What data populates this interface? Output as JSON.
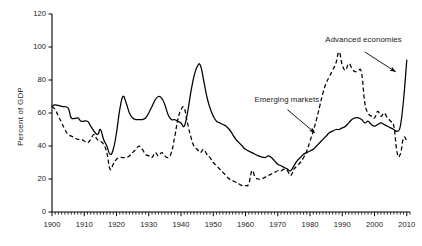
{
  "chart_data": {
    "type": "line",
    "title": "",
    "subtitle": "",
    "xlabel": "",
    "ylabel": "Percent of GDP",
    "xlim": [
      1900,
      2011
    ],
    "ylim": [
      0,
      120
    ],
    "yticks": [
      0,
      20,
      40,
      60,
      80,
      100,
      120
    ],
    "xticks": [
      1900,
      1910,
      1920,
      1930,
      1940,
      1950,
      1960,
      1970,
      1980,
      1990,
      2000,
      2010
    ],
    "xtick_labels": [
      "1900",
      "1910",
      "1920",
      "1930",
      "1940",
      "1950",
      "1960",
      "1970",
      "1980",
      "1990",
      "2000",
      "2010"
    ],
    "ytick_labels": [
      "0",
      "20",
      "40",
      "60",
      "80",
      "100",
      "120"
    ],
    "x_minor_tick_interval": 1,
    "grid": false,
    "legend_position": "none",
    "annotations": [
      {
        "name": "emerging-markets-annotation",
        "text": "Emerging markets",
        "label_x": 1964.0,
        "label_y": 68.0,
        "arrow_from_x": 1973.0,
        "arrow_from_y": 62.0,
        "arrow_to_x": 1981.5,
        "arrow_to_y": 48.0,
        "series": "Emerging markets"
      },
      {
        "name": "advanced-economies-annotation",
        "text": "Advanced economies",
        "label_x": 1986.0,
        "label_y": 104.0,
        "arrow_from_x": 1997.0,
        "arrow_from_y": 97.0,
        "arrow_to_x": 2006.5,
        "arrow_to_y": 85.0,
        "series": "Advanced economies"
      }
    ],
    "series": [
      {
        "name": "Advanced economies",
        "style": "solid",
        "color": "#000000",
        "x": [
          1900,
          1901,
          1902,
          1903,
          1904,
          1905,
          1906,
          1907,
          1908,
          1909,
          1910,
          1911,
          1912,
          1913,
          1914,
          1915,
          1916,
          1917,
          1918,
          1919,
          1920,
          1921,
          1922,
          1923,
          1924,
          1925,
          1926,
          1927,
          1928,
          1929,
          1930,
          1931,
          1932,
          1933,
          1934,
          1935,
          1936,
          1937,
          1938,
          1939,
          1940,
          1941,
          1942,
          1943,
          1944,
          1945,
          1946,
          1947,
          1948,
          1949,
          1950,
          1951,
          1952,
          1953,
          1954,
          1955,
          1956,
          1957,
          1958,
          1959,
          1960,
          1961,
          1962,
          1963,
          1964,
          1965,
          1966,
          1967,
          1968,
          1969,
          1970,
          1971,
          1972,
          1973,
          1974,
          1975,
          1976,
          1977,
          1978,
          1979,
          1980,
          1981,
          1982,
          1983,
          1984,
          1985,
          1986,
          1987,
          1988,
          1989,
          1990,
          1991,
          1992,
          1993,
          1994,
          1995,
          1996,
          1997,
          1998,
          1999,
          2000,
          2001,
          2002,
          2003,
          2004,
          2005,
          2006,
          2007,
          2008,
          2009,
          2010
        ],
        "values": [
          64,
          65,
          64,
          63,
          64,
          63,
          62,
          61,
          59,
          57,
          56,
          56,
          55,
          54,
          53,
          52,
          51,
          49,
          46,
          47,
          49,
          52,
          53,
          52,
          50,
          48,
          47,
          46,
          46,
          45,
          44,
          43,
          45,
          46,
          47,
          47,
          46,
          44,
          43,
          42,
          41,
          42,
          44,
          46,
          47,
          48,
          48,
          45,
          41,
          36,
          31,
          28,
          26,
          24,
          23,
          22,
          21,
          20,
          19,
          19,
          18,
          17,
          16,
          15,
          14,
          13,
          12,
          12,
          13,
          13,
          12,
          11,
          11,
          12,
          13,
          15,
          17,
          19,
          21,
          23,
          25,
          27,
          30,
          33,
          36,
          38,
          40,
          41,
          42,
          43,
          45,
          47,
          50,
          53,
          55,
          57,
          56,
          54,
          53,
          52,
          51,
          50,
          50,
          50,
          49,
          48,
          47,
          46,
          48,
          57,
          92
        ]
      },
      {
        "name": "Emerging markets",
        "style": "dashed",
        "color": "#000000",
        "x": [
          1900,
          1901,
          1902,
          1903,
          1904,
          1905,
          1906,
          1907,
          1908,
          1909,
          1910,
          1911,
          1912,
          1913,
          1914,
          1915,
          1916,
          1917,
          1918,
          1919,
          1920,
          1921,
          1922,
          1923,
          1924,
          1925,
          1926,
          1927,
          1928,
          1929,
          1930,
          1931,
          1932,
          1933,
          1934,
          1935,
          1936,
          1937,
          1938,
          1939,
          1940,
          1941,
          1942,
          1943,
          1944,
          1945,
          1946,
          1947,
          1948,
          1949,
          1950,
          1951,
          1952,
          1953,
          1954,
          1955,
          1956,
          1957,
          1958,
          1959,
          1960,
          1961,
          1962,
          1963,
          1964,
          1965,
          1966,
          1967,
          1968,
          1969,
          1970,
          1971,
          1972,
          1973,
          1974,
          1975,
          1976,
          1977,
          1978,
          1979,
          1980,
          1981,
          1982,
          1983,
          1984,
          1985,
          1986,
          1987,
          1988,
          1989,
          1990,
          1991,
          1992,
          1993,
          1994,
          1995,
          1996,
          1997,
          1998,
          1999,
          2000,
          2001,
          2002,
          2003,
          2004,
          2005,
          2006,
          2007,
          2008,
          2009,
          2010
        ],
        "values": [
          64,
          62,
          59,
          56,
          54,
          52,
          50,
          48,
          47,
          46,
          44,
          43,
          42,
          41,
          44,
          43,
          40,
          38,
          36,
          35,
          34,
          33,
          33,
          34,
          35,
          36,
          37,
          38,
          39,
          40,
          41,
          42,
          43,
          44,
          44,
          43,
          42,
          41,
          40,
          39,
          39,
          38,
          38,
          37,
          36,
          35,
          34,
          33,
          32,
          31,
          30,
          29,
          28,
          28,
          27,
          26,
          25,
          24,
          24,
          23,
          23,
          22,
          21,
          21,
          20,
          20,
          19,
          18,
          18,
          17,
          17,
          17,
          17,
          17,
          16,
          15,
          15,
          15,
          15,
          15,
          16,
          16,
          17,
          17,
          17,
          17,
          16,
          16,
          16,
          15,
          15,
          15,
          14,
          14,
          14,
          14,
          15,
          15,
          16,
          16,
          15,
          15,
          16,
          17,
          19,
          20,
          20,
          20,
          21,
          23,
          25
        ]
      }
    ],
    "series_visual_note": {
      "Advanced economies": "solid black line, starts ~64 in 1900, falls to ~35 by 1918, peaks ~70 in 1922 and ~70 in 1933, WWII peak ~89 in 1946, trough ~25 in 1974, rises to ~57 in 1995, dips to ~48 by 2007, sharp spike to ~92 in 2010",
      "Emerging markets": "dashed black line, starts ~64 in 1900, falls to ~26 in 1918, recovers to ~40 in 1932 peak ~63, lows ~14-16 through 1950s, bump ~25 in 1962, trough ~22 in 1974, climbs steeply to peak ~97 in 1989, falls to ~35 by 2008, ends ~43 in 2010"
    }
  },
  "chart_points": {
    "advanced": [
      [
        1900,
        64
      ],
      [
        1901,
        65
      ],
      [
        1903,
        64
      ],
      [
        1905,
        63
      ],
      [
        1906,
        57
      ],
      [
        1908,
        57
      ],
      [
        1909,
        55
      ],
      [
        1911,
        55
      ],
      [
        1912,
        52
      ],
      [
        1914,
        47
      ],
      [
        1915,
        50
      ],
      [
        1916,
        44
      ],
      [
        1917,
        40
      ],
      [
        1918,
        35
      ],
      [
        1919,
        38
      ],
      [
        1920,
        48
      ],
      [
        1921,
        62
      ],
      [
        1922,
        70
      ],
      [
        1923,
        66
      ],
      [
        1924,
        60
      ],
      [
        1925,
        57
      ],
      [
        1926,
        56
      ],
      [
        1927,
        56
      ],
      [
        1928,
        56
      ],
      [
        1929,
        57
      ],
      [
        1930,
        60
      ],
      [
        1931,
        64
      ],
      [
        1932,
        68
      ],
      [
        1933,
        70
      ],
      [
        1934,
        69
      ],
      [
        1935,
        65
      ],
      [
        1936,
        59
      ],
      [
        1937,
        56
      ],
      [
        1938,
        56
      ],
      [
        1939,
        55
      ],
      [
        1940,
        54
      ],
      [
        1941,
        52
      ],
      [
        1942,
        60
      ],
      [
        1943,
        72
      ],
      [
        1944,
        82
      ],
      [
        1945,
        88
      ],
      [
        1946,
        89
      ],
      [
        1947,
        80
      ],
      [
        1948,
        70
      ],
      [
        1949,
        63
      ],
      [
        1950,
        58
      ],
      [
        1951,
        55
      ],
      [
        1952,
        54
      ],
      [
        1953,
        53
      ],
      [
        1954,
        52
      ],
      [
        1955,
        50
      ],
      [
        1956,
        47
      ],
      [
        1957,
        44
      ],
      [
        1958,
        42
      ],
      [
        1959,
        40
      ],
      [
        1960,
        38
      ],
      [
        1962,
        36
      ],
      [
        1964,
        34
      ],
      [
        1966,
        33
      ],
      [
        1967,
        34
      ],
      [
        1968,
        33
      ],
      [
        1969,
        31
      ],
      [
        1970,
        29
      ],
      [
        1971,
        28
      ],
      [
        1972,
        27
      ],
      [
        1973,
        26
      ],
      [
        1974,
        25
      ],
      [
        1975,
        28
      ],
      [
        1976,
        31
      ],
      [
        1977,
        33
      ],
      [
        1978,
        35
      ],
      [
        1979,
        36
      ],
      [
        1980,
        37
      ],
      [
        1981,
        38
      ],
      [
        1982,
        40
      ],
      [
        1983,
        42
      ],
      [
        1984,
        44
      ],
      [
        1985,
        46
      ],
      [
        1986,
        48
      ],
      [
        1987,
        49
      ],
      [
        1988,
        50
      ],
      [
        1989,
        50
      ],
      [
        1990,
        51
      ],
      [
        1991,
        52
      ],
      [
        1992,
        54
      ],
      [
        1993,
        56
      ],
      [
        1994,
        57
      ],
      [
        1995,
        57
      ],
      [
        1996,
        56
      ],
      [
        1997,
        54
      ],
      [
        1998,
        55
      ],
      [
        1999,
        53
      ],
      [
        2000,
        52
      ],
      [
        2001,
        53
      ],
      [
        2002,
        54
      ],
      [
        2003,
        53
      ],
      [
        2004,
        52
      ],
      [
        2005,
        51
      ],
      [
        2006,
        50
      ],
      [
        2007,
        49
      ],
      [
        2008,
        52
      ],
      [
        2009,
        68
      ],
      [
        2010,
        92
      ]
    ],
    "emerging": [
      [
        1900,
        64
      ],
      [
        1901,
        62
      ],
      [
        1902,
        58
      ],
      [
        1903,
        54
      ],
      [
        1904,
        50
      ],
      [
        1905,
        47
      ],
      [
        1906,
        46
      ],
      [
        1907,
        45
      ],
      [
        1908,
        44
      ],
      [
        1909,
        44
      ],
      [
        1910,
        43
      ],
      [
        1911,
        42
      ],
      [
        1912,
        44
      ],
      [
        1913,
        47
      ],
      [
        1914,
        44
      ],
      [
        1915,
        43
      ],
      [
        1916,
        41
      ],
      [
        1917,
        36
      ],
      [
        1918,
        26
      ],
      [
        1919,
        29
      ],
      [
        1920,
        32
      ],
      [
        1921,
        33
      ],
      [
        1922,
        33
      ],
      [
        1923,
        33
      ],
      [
        1924,
        34
      ],
      [
        1925,
        36
      ],
      [
        1926,
        38
      ],
      [
        1927,
        40
      ],
      [
        1928,
        38
      ],
      [
        1929,
        35
      ],
      [
        1930,
        34
      ],
      [
        1931,
        33
      ],
      [
        1932,
        36
      ],
      [
        1933,
        34
      ],
      [
        1934,
        36
      ],
      [
        1935,
        34
      ],
      [
        1936,
        33
      ],
      [
        1937,
        36
      ],
      [
        1938,
        45
      ],
      [
        1939,
        56
      ],
      [
        1940,
        62
      ],
      [
        1941,
        63
      ],
      [
        1942,
        54
      ],
      [
        1943,
        46
      ],
      [
        1944,
        40
      ],
      [
        1945,
        38
      ],
      [
        1946,
        36
      ],
      [
        1947,
        38
      ],
      [
        1948,
        35
      ],
      [
        1949,
        33
      ],
      [
        1950,
        30
      ],
      [
        1951,
        28
      ],
      [
        1952,
        26
      ],
      [
        1953,
        24
      ],
      [
        1954,
        22
      ],
      [
        1955,
        20
      ],
      [
        1956,
        19
      ],
      [
        1957,
        18
      ],
      [
        1958,
        17
      ],
      [
        1959,
        16
      ],
      [
        1960,
        16
      ],
      [
        1961,
        17
      ],
      [
        1962,
        25
      ],
      [
        1963,
        21
      ],
      [
        1964,
        20
      ],
      [
        1965,
        20
      ],
      [
        1966,
        21
      ],
      [
        1967,
        22
      ],
      [
        1968,
        23
      ],
      [
        1969,
        24
      ],
      [
        1970,
        25
      ],
      [
        1971,
        25
      ],
      [
        1972,
        26
      ],
      [
        1973,
        25
      ],
      [
        1974,
        22
      ],
      [
        1975,
        26
      ],
      [
        1976,
        28
      ],
      [
        1977,
        30
      ],
      [
        1978,
        33
      ],
      [
        1979,
        37
      ],
      [
        1980,
        43
      ],
      [
        1981,
        49
      ],
      [
        1982,
        56
      ],
      [
        1983,
        64
      ],
      [
        1984,
        72
      ],
      [
        1985,
        78
      ],
      [
        1986,
        82
      ],
      [
        1987,
        86
      ],
      [
        1988,
        90
      ],
      [
        1989,
        97
      ],
      [
        1990,
        89
      ],
      [
        1991,
        86
      ],
      [
        1992,
        90
      ],
      [
        1993,
        87
      ],
      [
        1994,
        85
      ],
      [
        1995,
        86
      ],
      [
        1996,
        84
      ],
      [
        1997,
        66
      ],
      [
        1998,
        60
      ],
      [
        1999,
        58
      ],
      [
        2000,
        57
      ],
      [
        2001,
        61
      ],
      [
        2002,
        58
      ],
      [
        2003,
        60
      ],
      [
        2004,
        57
      ],
      [
        2005,
        55
      ],
      [
        2006,
        52
      ],
      [
        2007,
        36
      ],
      [
        2008,
        35
      ],
      [
        2009,
        45
      ],
      [
        2010,
        43
      ]
    ]
  },
  "axes": {
    "ylabel": "Percent of GDP",
    "ytick_labels": [
      "120",
      "100",
      "80",
      "60",
      "40",
      "20",
      "0"
    ],
    "xtick_labels": [
      "1900",
      "1910",
      "1920",
      "1930",
      "1940",
      "1950",
      "1960",
      "1970",
      "1980",
      "1990",
      "2000",
      "2010"
    ]
  },
  "annotation_labels": {
    "emerging": "Emerging markets",
    "advanced": "Advanced economies"
  },
  "style": {
    "line_color": "#000000",
    "axis_color": "#000000",
    "background": "#ffffff"
  }
}
